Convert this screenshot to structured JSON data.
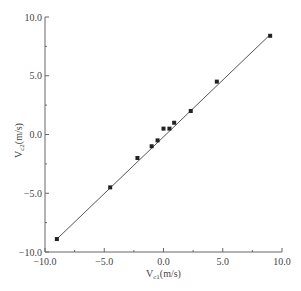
{
  "chart_data": {
    "type": "scatter",
    "title": "",
    "xlabel": "V",
    "xlabel_sub": "c1",
    "xlabel_unit": "(m/s)",
    "ylabel": "V",
    "ylabel_sub": "c2",
    "ylabel_unit": "(m/s)",
    "xlim": [
      -10.0,
      10.0
    ],
    "ylim": [
      -10.0,
      10.0
    ],
    "x_ticks": [
      "-10.0",
      "-5.0",
      "0.0",
      "5.0",
      "10.0"
    ],
    "y_ticks": [
      "-10.0",
      "-5.0",
      "0.0",
      "5.0",
      "10.0"
    ],
    "grid": false,
    "legend": null,
    "series": [
      {
        "name": "measured",
        "marker": "square",
        "x": [
          -9.0,
          -4.5,
          -2.2,
          -1.0,
          -0.5,
          0.0,
          0.5,
          0.9,
          2.3,
          4.5,
          9.0
        ],
        "y": [
          -8.9,
          -4.5,
          -2.0,
          -1.0,
          -0.5,
          0.5,
          0.5,
          1.0,
          2.0,
          4.5,
          8.4
        ]
      },
      {
        "name": "fit line",
        "type": "line",
        "x": [
          -9.0,
          9.0
        ],
        "y": [
          -8.9,
          8.5
        ]
      }
    ]
  },
  "colors": {
    "axis": "#555555",
    "marker": "#222222",
    "line": "#555555"
  }
}
